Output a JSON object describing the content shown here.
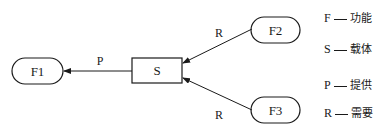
{
  "diagram": {
    "nodes": {
      "f1": {
        "label": "F1",
        "shape": "pill"
      },
      "s": {
        "label": "S",
        "shape": "rectangle"
      },
      "f2": {
        "label": "F2",
        "shape": "pill"
      },
      "f3": {
        "label": "F3",
        "shape": "pill"
      }
    },
    "edges": [
      {
        "from": "S",
        "to": "F1",
        "label": "P"
      },
      {
        "from": "F2",
        "to": "S",
        "label": "R"
      },
      {
        "from": "F3",
        "to": "S",
        "label": "R"
      }
    ]
  },
  "legend": [
    {
      "key": "F",
      "value": "功能"
    },
    {
      "key": "S",
      "value": "载体"
    },
    {
      "key": "P",
      "value": "提供"
    },
    {
      "key": "R",
      "value": "需要"
    }
  ],
  "colors": {
    "stroke": "#1a1a1a",
    "background": "#ffffff"
  }
}
